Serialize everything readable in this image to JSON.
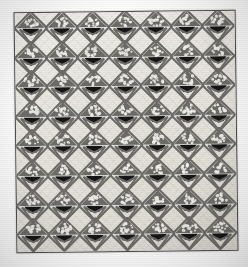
{
  "image": {
    "subject": "antique pieced basket-pattern quilt",
    "title": "Basket Quilt",
    "orientation": "portrait",
    "background_color": "#ffffff",
    "tone": "black and white photograph"
  },
  "quilt": {
    "binding_color": "#4b4a48",
    "ground_color": "#e9e7e2",
    "print_color": "#6e6c68",
    "basket_color": "#151515",
    "highlight_color": "#f2f0ea",
    "border_label": "narrow dark binding",
    "grid": {
      "columns": 7,
      "rows": 8,
      "total_blocks": 56,
      "col_pitch": 31.2,
      "row_pitch": 29.6,
      "motif_size": 34,
      "origin_x": -1,
      "origin_y": -2,
      "block_name": "basket-block"
    }
  },
  "motif": {
    "name": "flower-basket-diamond",
    "parts": [
      "diamond-outline",
      "printed-fan",
      "flower-dots",
      "solid-basket-base",
      "basket-foot"
    ]
  },
  "photo": {
    "vignette": true,
    "grain": true,
    "rotation_deg": -0.7
  }
}
